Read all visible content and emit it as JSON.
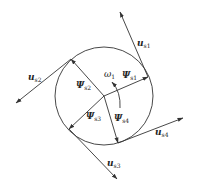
{
  "diagram": {
    "type": "phasor-diagram",
    "circle": {
      "cx": 104,
      "cy": 96,
      "r": 49
    },
    "center": {
      "x": 104,
      "y": 96
    },
    "flux_vectors": [
      {
        "id": "psi_s1",
        "symbol": "Ψ",
        "sub": "s1",
        "to": [
          148,
          77
        ]
      },
      {
        "id": "psi_s2",
        "symbol": "Ψ",
        "sub": "s2",
        "to": [
          71,
          59
        ]
      },
      {
        "id": "psi_s3",
        "symbol": "Ψ",
        "sub": "s3",
        "to": [
          69,
          129
        ]
      },
      {
        "id": "psi_s4",
        "symbol": "Ψ",
        "sub": "s4",
        "to": [
          118,
          143
        ]
      }
    ],
    "voltage_vectors": [
      {
        "id": "u_s1",
        "symbol": "u",
        "sub": "s1",
        "from": [
          148,
          77
        ],
        "to": [
          120,
          12
        ]
      },
      {
        "id": "u_s2",
        "symbol": "u",
        "sub": "s2",
        "from": [
          71,
          59
        ],
        "to": [
          16,
          103
        ]
      },
      {
        "id": "u_s3",
        "symbol": "u",
        "sub": "s3",
        "from": [
          69,
          129
        ],
        "to": [
          117,
          179
        ]
      },
      {
        "id": "u_s4",
        "symbol": "u",
        "sub": "s4",
        "from": [
          118,
          143
        ],
        "to": [
          183,
          118
        ]
      }
    ],
    "rotation": {
      "symbol": "ω",
      "sub": "1",
      "direction": "counter-clockwise"
    },
    "labels": {
      "u_s1": {
        "main": "u",
        "sub": "s1"
      },
      "u_s2": {
        "main": "u",
        "sub": "s2"
      },
      "u_s3": {
        "main": "u",
        "sub": "s3"
      },
      "u_s4": {
        "main": "u",
        "sub": "s4"
      },
      "psi_s1": {
        "main": "Ψ",
        "sub": "s1"
      },
      "psi_s2": {
        "main": "Ψ",
        "sub": "s2"
      },
      "psi_s3": {
        "main": "Ψ",
        "sub": "s3"
      },
      "psi_s4": {
        "main": "Ψ",
        "sub": "s4"
      },
      "omega": {
        "main": "ω",
        "sub": "1"
      }
    },
    "colors": {
      "line": "#333333",
      "background": "#ffffff"
    }
  }
}
